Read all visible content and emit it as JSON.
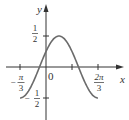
{
  "chart_data": {
    "type": "line",
    "title": "",
    "function": "y = (1/2)·cos(2x − π/3)",
    "xlabel": "x",
    "ylabel": "y",
    "x_ticks": [
      {
        "value": -1.0472,
        "label": "−π/3",
        "num": "π",
        "den": "3",
        "sign": "−"
      },
      {
        "value": 1.0472,
        "label": "π/3",
        "num": "",
        "den": "",
        "sign": ""
      },
      {
        "value": 2.0944,
        "label": "2π/3",
        "num": "2π",
        "den": "3",
        "sign": ""
      }
    ],
    "y_ticks": [
      {
        "value": 0.5,
        "label": "1/2",
        "num": "1",
        "den": "2",
        "sign": ""
      },
      {
        "value": -0.5,
        "label": "−1/2",
        "num": "1",
        "den": "2",
        "sign": "−"
      }
    ],
    "origin_label": "0",
    "xlim": [
      -1.35,
      2.5
    ],
    "ylim": [
      -0.75,
      0.95
    ],
    "x_domain": [
      -1.0472,
      2.0944
    ],
    "key_points": [
      {
        "x": -1.0472,
        "y": -0.5
      },
      {
        "x": -0.2618,
        "y": 0
      },
      {
        "x": 0,
        "y": 0.25
      },
      {
        "x": 0.5236,
        "y": 0.5
      },
      {
        "x": 1.309,
        "y": 0
      },
      {
        "x": 2.0944,
        "y": -0.5
      }
    ],
    "grid": false,
    "legend": null,
    "colors": {
      "curve": "#6b6b6b",
      "axes": "#333333"
    }
  },
  "labels": {
    "x_axis": "x",
    "y_axis": "y",
    "origin": "0",
    "y_half_num": "1",
    "y_half_den": "2",
    "y_neg_half_sign": "−",
    "y_neg_half_num": "1",
    "y_neg_half_den": "2",
    "x_neg_pi3_sign": "−",
    "x_neg_pi3_num": "π",
    "x_neg_pi3_den": "3",
    "x_2pi3_num": "2π",
    "x_2pi3_den": "3"
  }
}
